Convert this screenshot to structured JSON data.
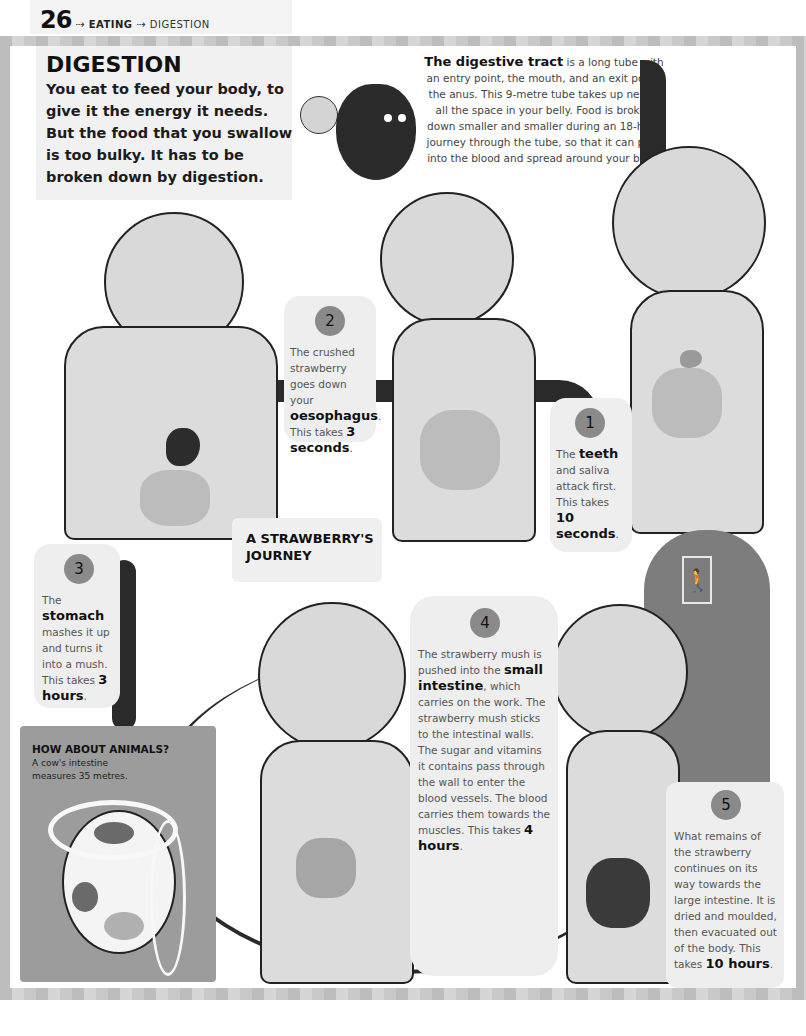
{
  "header": {
    "page_number": "26",
    "arrow_icon": "dotted-arrow-right",
    "crumbs": [
      "EATING",
      "DIGESTION"
    ]
  },
  "intro": {
    "title": "DIGESTION",
    "text": "You eat to feed your body, to give it the energy it needs. But the food that you swallow is too bulky. It has to be broken down by digestion."
  },
  "tract": {
    "lead": "The digestive tract",
    "text": " is a long tube with an entry point, the mouth, and an exit point, the anus. This 9-metre tube takes up nearly all the space in your belly. Food is broken down smaller and smaller during an 18-hour journey through the tube, so that it can pass into the blood and spread around your body."
  },
  "journey_label": {
    "line1": "A STRAWBERRY'S",
    "line2": "JOURNEY"
  },
  "steps": [
    {
      "number": "1",
      "pre": "The ",
      "bold": "teeth",
      "text": " and saliva attack first. This takes ",
      "time": "10 seconds",
      "end": "."
    },
    {
      "number": "2",
      "pre": "The crushed strawberry goes down your ",
      "bold": "oesophagus",
      "text": ". This takes ",
      "time": "3 seconds",
      "end": "."
    },
    {
      "number": "3",
      "pre": "The ",
      "bold": "stomach",
      "text": " mashes it up and turns it into a mush. This takes ",
      "time": "3 hours",
      "end": "."
    },
    {
      "number": "4",
      "pre": "The strawberry mush is pushed into the ",
      "bold": "small intestine",
      "text": ", which carries on the work. The strawberry mush sticks to the intestinal walls. The sugar and vitamins it contains pass through the wall to enter the blood vessels. The blood carries them towards the muscles. This takes ",
      "time": "4 hours",
      "end": "."
    },
    {
      "number": "5",
      "pre": "What remains of the strawberry continues on its way towards the large intestine. It is dried and moulded, then evacuated out of the body. This takes ",
      "bold": "",
      "text": "",
      "time": "10 hours",
      "end": "."
    }
  ],
  "animals": {
    "title": "HOW ABOUT ANIMALS?",
    "text": "A cow's intestine measures 35 metres."
  },
  "door_sign": {
    "icon": "person-icon",
    "glyph": "🚶"
  },
  "colors": {
    "page_bg": "#ffffff",
    "frame_light": "#d6d6d6",
    "frame_dark": "#bdbdbd",
    "card_bg": "#eeeeee",
    "badge": "#8a8a8a",
    "tube": "#2a2a2a"
  }
}
